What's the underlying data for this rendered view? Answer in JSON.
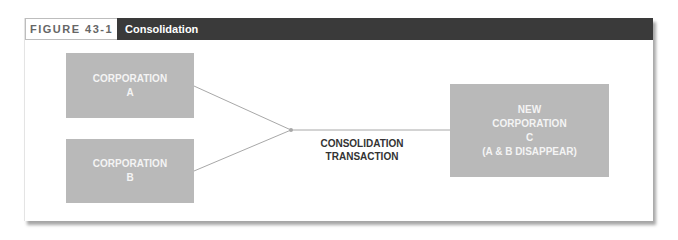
{
  "figure": {
    "number_label": "FIGURE 43-1",
    "title": "Consolidation"
  },
  "diagram": {
    "box_a": {
      "line1": "CORPORATION",
      "line2": "A"
    },
    "box_b": {
      "line1": "CORPORATION",
      "line2": "B"
    },
    "box_c": {
      "line1": "NEW",
      "line2": "CORPORATION",
      "line3": "C",
      "line4": "(A & B DISAPPEAR)"
    },
    "transaction_label": {
      "line1": "CONSOLIDATION",
      "line2": "TRANSACTION"
    }
  },
  "colors": {
    "header_bg": "#3a3a3a",
    "box_fill": "#b9b9b9",
    "connector": "#a8a8a8"
  }
}
